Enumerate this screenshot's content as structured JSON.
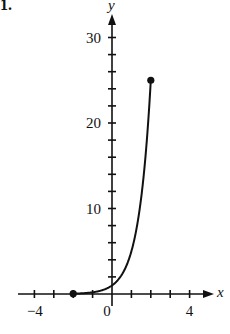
{
  "problem_label": "1.",
  "chart_data": {
    "type": "line",
    "title": "",
    "xlabel": "x",
    "ylabel": "y",
    "xlim": [
      -5,
      5
    ],
    "ylim": [
      0,
      32
    ],
    "x_tick_step": 1,
    "y_tick_step": 2,
    "x_tick_labels": [
      {
        "value": -4,
        "label": "−4"
      },
      {
        "value": 0,
        "label": "0"
      },
      {
        "value": 4,
        "label": "4"
      }
    ],
    "y_tick_labels": [
      {
        "value": 10,
        "label": "10"
      },
      {
        "value": 20,
        "label": "20"
      },
      {
        "value": 30,
        "label": "30"
      }
    ],
    "grid": false,
    "series": [
      {
        "name": "f(x) = 5^x",
        "function": "5^x",
        "domain": [
          -2,
          2
        ],
        "x": [
          -2,
          -1.5,
          -1,
          -0.5,
          0,
          0.5,
          1,
          1.5,
          2
        ],
        "values": [
          0.04,
          0.09,
          0.2,
          0.45,
          1,
          2.24,
          5,
          11.18,
          25
        ],
        "endpoints": [
          {
            "x": -2,
            "y": 0.04,
            "closed": true
          },
          {
            "x": 2,
            "y": 25,
            "closed": true
          }
        ]
      }
    ]
  }
}
